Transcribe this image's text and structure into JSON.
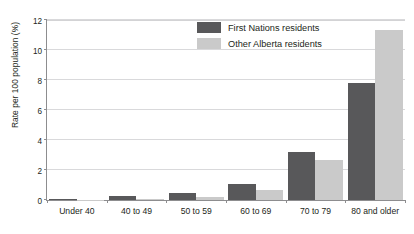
{
  "title_remnant": "",
  "chart_data": {
    "type": "bar",
    "title": "",
    "xlabel": "",
    "ylabel": "Rate per 100 population (%)",
    "ylim": [
      0,
      12
    ],
    "ytick_values": [
      0,
      2,
      4,
      6,
      8,
      10,
      12
    ],
    "ytick_labels": [
      "0",
      "2",
      "4",
      "6",
      "8",
      "10",
      "12"
    ],
    "grid": true,
    "legend_position": "upper center",
    "categories": [
      "Under 40",
      "40 to 49",
      "50 to 59",
      "60 to 69",
      "70 to 79",
      "80 and older"
    ],
    "series": [
      {
        "name": "First Nations residents",
        "color": "#58585a",
        "values": [
          0.1,
          0.25,
          0.45,
          1.05,
          3.2,
          7.8
        ]
      },
      {
        "name": "Other Alberta residents",
        "color": "#cacaca",
        "values": [
          0.02,
          0.05,
          0.2,
          0.65,
          2.65,
          11.35
        ]
      }
    ]
  }
}
